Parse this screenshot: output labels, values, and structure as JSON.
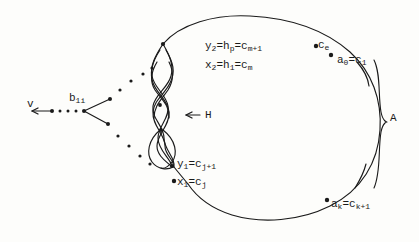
{
  "figure": {
    "type": "hand-drawn mathematical diagram",
    "ink_color": "#1a1a1a",
    "background_color": "#fdfdfb"
  },
  "labels": {
    "v": "v",
    "b1i": "b",
    "b1i_sub": "1i",
    "H": "H",
    "H_arrow": "←",
    "A": "A",
    "ce": "c",
    "ce_sub": "e",
    "y2_main": "y",
    "y2_sub": "2",
    "y2_eq1": "=h",
    "y2_sub2": "p",
    "y2_eq2": "=c",
    "y2_sub3": "m+1",
    "x2_main": "x",
    "x2_sub": "2",
    "x2_eq1": "=h",
    "x2_sub2": "1",
    "x2_eq2": "=c",
    "x2_sub3": "m",
    "a0_main": "a",
    "a0_sub": "0",
    "a0_eq": "=c",
    "a0_sub2": "1",
    "y1_main": "y",
    "y1_sub": "1",
    "y1_eq": "=c",
    "y1_sub2": "j+1",
    "x1_main": "x",
    "x1_sub": "1",
    "x1_eq": "=c",
    "x1_sub2": "j",
    "ak_main": "a",
    "ak_sub": "k",
    "ak_eq": "=c",
    "ak_sub2": "k+1"
  }
}
